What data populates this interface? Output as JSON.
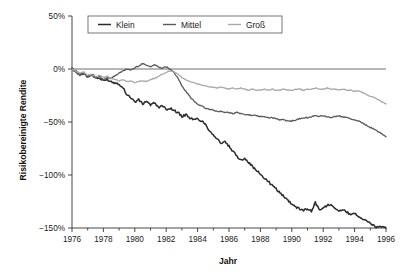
{
  "chart_data": {
    "type": "line",
    "title": "",
    "xlabel": "Jahr",
    "ylabel": "Risikobereinigte Rendite",
    "xlim": [
      1976,
      1996
    ],
    "ylim": [
      -150,
      50
    ],
    "grid": false,
    "legend_position": "top-center",
    "x_tick_labels": [
      "1976",
      "1978",
      "1980",
      "1982",
      "1984",
      "1986",
      "1988",
      "1990",
      "1992",
      "1994",
      "1996"
    ],
    "x_tick_values": [
      1976,
      1978,
      1980,
      1982,
      1984,
      1986,
      1988,
      1990,
      1992,
      1994,
      1996
    ],
    "y_tick_labels": [
      "50%",
      "0%",
      "−50%",
      "−100%",
      "−150%"
    ],
    "y_tick_values": [
      50,
      0,
      -50,
      -100,
      -150
    ],
    "x_minor_tick_step": 1,
    "zero_reference_line": 0,
    "series": [
      {
        "name": "Klein",
        "color": "#2b2b2b",
        "width": 1.5,
        "x": [
          1976.0,
          1976.25,
          1976.5,
          1976.75,
          1977.0,
          1977.25,
          1977.5,
          1977.75,
          1978.0,
          1978.25,
          1978.5,
          1978.75,
          1979.0,
          1979.25,
          1979.5,
          1979.75,
          1980.0,
          1980.25,
          1980.5,
          1980.75,
          1981.0,
          1981.25,
          1981.5,
          1981.75,
          1982.0,
          1982.25,
          1982.5,
          1982.75,
          1983.0,
          1983.25,
          1983.5,
          1983.75,
          1984.0,
          1984.25,
          1984.5,
          1984.75,
          1985.0,
          1985.25,
          1985.5,
          1985.75,
          1986.0,
          1986.25,
          1986.5,
          1986.75,
          1987.0,
          1987.25,
          1987.5,
          1987.75,
          1988.0,
          1988.25,
          1988.5,
          1988.75,
          1989.0,
          1989.25,
          1989.5,
          1989.75,
          1990.0,
          1990.25,
          1990.5,
          1990.75,
          1991.0,
          1991.25,
          1991.5,
          1991.75,
          1992.0,
          1992.25,
          1992.5,
          1992.75,
          1993.0,
          1993.25,
          1993.5,
          1993.75,
          1994.0,
          1994.25,
          1994.5,
          1994.75,
          1995.0,
          1995.25,
          1995.5,
          1995.75,
          1996.0
        ],
        "y": [
          0,
          -2,
          -5,
          -4,
          -7,
          -5,
          -8,
          -9,
          -11,
          -10,
          -12,
          -13,
          -14,
          -18,
          -24,
          -27,
          -31,
          -29,
          -33,
          -30,
          -34,
          -32,
          -36,
          -35,
          -38,
          -37,
          -39,
          -41,
          -45,
          -43,
          -46,
          -48,
          -47,
          -49,
          -52,
          -58,
          -62,
          -66,
          -70,
          -69,
          -73,
          -78,
          -82,
          -86,
          -84,
          -88,
          -92,
          -96,
          -99,
          -103,
          -106,
          -110,
          -113,
          -117,
          -120,
          -124,
          -127,
          -130,
          -132,
          -133,
          -132,
          -134,
          -126,
          -133,
          -131,
          -129,
          -127,
          -131,
          -134,
          -133,
          -135,
          -137,
          -136,
          -139,
          -141,
          -143,
          -146,
          -148,
          -150,
          -148,
          -150
        ]
      },
      {
        "name": "Mittel",
        "color": "#5a5a5a",
        "width": 1.3,
        "x": [
          1976.0,
          1976.25,
          1976.5,
          1976.75,
          1977.0,
          1977.25,
          1977.5,
          1977.75,
          1978.0,
          1978.25,
          1978.5,
          1978.75,
          1979.0,
          1979.25,
          1979.5,
          1979.75,
          1980.0,
          1980.25,
          1980.5,
          1980.75,
          1981.0,
          1981.25,
          1981.5,
          1981.75,
          1982.0,
          1982.25,
          1982.5,
          1982.75,
          1983.0,
          1983.25,
          1983.5,
          1983.75,
          1984.0,
          1984.25,
          1984.5,
          1984.75,
          1985.0,
          1985.25,
          1985.5,
          1985.75,
          1986.0,
          1986.25,
          1986.5,
          1986.75,
          1987.0,
          1987.25,
          1987.5,
          1987.75,
          1988.0,
          1988.25,
          1988.5,
          1988.75,
          1989.0,
          1989.25,
          1989.5,
          1989.75,
          1990.0,
          1990.25,
          1990.5,
          1990.75,
          1991.0,
          1991.25,
          1991.5,
          1991.75,
          1992.0,
          1992.25,
          1992.5,
          1992.75,
          1993.0,
          1993.25,
          1993.5,
          1993.75,
          1994.0,
          1994.25,
          1994.5,
          1994.75,
          1995.0,
          1995.25,
          1995.5,
          1995.75,
          1996.0
        ],
        "y": [
          0,
          -3,
          -6,
          -4,
          -8,
          -6,
          -9,
          -7,
          -10,
          -8,
          -9,
          -6,
          -4,
          -2,
          0,
          -1,
          1,
          3,
          5,
          4,
          2,
          4,
          2,
          1,
          2,
          0,
          -3,
          -9,
          -16,
          -21,
          -26,
          -30,
          -33,
          -35,
          -37,
          -38,
          -39,
          -40,
          -40,
          -41,
          -41,
          -42,
          -41,
          -42,
          -43,
          -43,
          -44,
          -44,
          -45,
          -45,
          -46,
          -46,
          -47,
          -48,
          -48,
          -49,
          -49,
          -48,
          -47,
          -46,
          -46,
          -45,
          -44,
          -45,
          -44,
          -45,
          -46,
          -45,
          -44,
          -45,
          -46,
          -47,
          -48,
          -49,
          -51,
          -53,
          -55,
          -57,
          -59,
          -61,
          -64
        ]
      },
      {
        "name": "Groß",
        "color": "#a8a8a8",
        "width": 1.3,
        "x": [
          1976.0,
          1976.25,
          1976.5,
          1976.75,
          1977.0,
          1977.25,
          1977.5,
          1977.75,
          1978.0,
          1978.25,
          1978.5,
          1978.75,
          1979.0,
          1979.25,
          1979.5,
          1979.75,
          1980.0,
          1980.25,
          1980.5,
          1980.75,
          1981.0,
          1981.25,
          1981.5,
          1981.75,
          1982.0,
          1982.25,
          1982.5,
          1982.75,
          1983.0,
          1983.25,
          1983.5,
          1983.75,
          1984.0,
          1984.25,
          1984.5,
          1984.75,
          1985.0,
          1985.25,
          1985.5,
          1985.75,
          1986.0,
          1986.25,
          1986.5,
          1986.75,
          1987.0,
          1987.25,
          1987.5,
          1987.75,
          1988.0,
          1988.25,
          1988.5,
          1988.75,
          1989.0,
          1989.25,
          1989.5,
          1989.75,
          1990.0,
          1990.25,
          1990.5,
          1990.75,
          1991.0,
          1991.25,
          1991.5,
          1991.75,
          1992.0,
          1992.25,
          1992.5,
          1992.75,
          1993.0,
          1993.25,
          1993.5,
          1993.75,
          1994.0,
          1994.25,
          1994.5,
          1994.75,
          1995.0,
          1995.25,
          1995.5,
          1995.75,
          1996.0
        ],
        "y": [
          0,
          -2,
          -4,
          -3,
          -6,
          -5,
          -7,
          -6,
          -8,
          -7,
          -9,
          -10,
          -11,
          -10,
          -12,
          -11,
          -13,
          -12,
          -11,
          -12,
          -10,
          -9,
          -7,
          -5,
          -3,
          -2,
          -3,
          -5,
          -8,
          -10,
          -12,
          -13,
          -14,
          -15,
          -16,
          -17,
          -17,
          -18,
          -17,
          -18,
          -19,
          -18,
          -19,
          -18,
          -19,
          -20,
          -19,
          -20,
          -20,
          -19,
          -20,
          -19,
          -20,
          -20,
          -19,
          -20,
          -20,
          -19,
          -19,
          -20,
          -19,
          -19,
          -18,
          -19,
          -19,
          -18,
          -19,
          -19,
          -20,
          -19,
          -20,
          -20,
          -21,
          -21,
          -22,
          -24,
          -26,
          -27,
          -29,
          -31,
          -33
        ]
      }
    ]
  },
  "legend": {
    "items": [
      {
        "label": "Klein"
      },
      {
        "label": "Mittel"
      },
      {
        "label": "Groß"
      }
    ]
  }
}
